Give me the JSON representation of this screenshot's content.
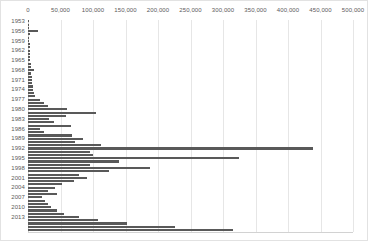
{
  "chart_data": {
    "type": "bar",
    "orientation": "horizontal",
    "title": "",
    "subtitle": "",
    "xlabel": "",
    "ylabel": "",
    "xlim": [
      0,
      500000
    ],
    "ylim_categories": [
      "1953",
      "2017"
    ],
    "grid": "vertical",
    "legend": "none",
    "bar_color": "#595959",
    "gridline_color": "#e6e6e6",
    "background_color": "#ffffff",
    "border_color": "#e2e2e2",
    "xticks": [
      0,
      50000,
      100000,
      150000,
      200000,
      250000,
      300000,
      350000,
      400000,
      450000,
      500000
    ],
    "xtick_labels": [
      "0",
      "50,000",
      "100,000",
      "150,000",
      "200,000",
      "250,000",
      "300,000",
      "350,000",
      "400,000",
      "450,000",
      "500,000"
    ],
    "ytick_labels": [
      "1953",
      "1956",
      "1959",
      "1962",
      "1965",
      "1968",
      "1971",
      "1974",
      "1977",
      "1980",
      "1983",
      "1986",
      "1989",
      "1992",
      "1995",
      "1998",
      "2001",
      "2004",
      "2007",
      "2010",
      "2013"
    ],
    "ytick_interval": 3,
    "categories": [
      "1953",
      "1954",
      "1955",
      "1956",
      "1957",
      "1958",
      "1959",
      "1960",
      "1961",
      "1962",
      "1963",
      "1964",
      "1965",
      "1966",
      "1967",
      "1968",
      "1969",
      "1970",
      "1971",
      "1972",
      "1973",
      "1974",
      "1975",
      "1976",
      "1977",
      "1978",
      "1979",
      "1980",
      "1981",
      "1982",
      "1983",
      "1984",
      "1985",
      "1986",
      "1987",
      "1988",
      "1989",
      "1990",
      "1991",
      "1992",
      "1993",
      "1994",
      "1995",
      "1996",
      "1997",
      "1998",
      "1999",
      "2000",
      "2001",
      "2002",
      "2003",
      "2004",
      "2005",
      "2006",
      "2007",
      "2008",
      "2009",
      "2010",
      "2011",
      "2012",
      "2013",
      "2014",
      "2015",
      "2016",
      "2017"
    ],
    "values": [
      1500,
      2000,
      1800,
      15000,
      2500,
      2000,
      2200,
      2600,
      2400,
      2800,
      3000,
      3200,
      3600,
      4000,
      4400,
      9000,
      5200,
      5600,
      6000,
      6400,
      7000,
      8000,
      9000,
      10000,
      18000,
      24000,
      30000,
      60000,
      105000,
      58000,
      32000,
      40000,
      66000,
      18000,
      24000,
      68000,
      85000,
      72000,
      112000,
      438000,
      95000,
      100000,
      325000,
      140000,
      96000,
      188000,
      124000,
      78000,
      90000,
      70000,
      52000,
      42000,
      30000,
      44000,
      22000,
      26000,
      30000,
      36000,
      44000,
      56000,
      78000,
      108000,
      152000,
      226000,
      315000
    ]
  }
}
